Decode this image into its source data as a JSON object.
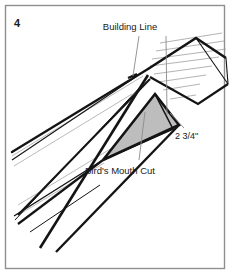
{
  "figure": {
    "number": "4",
    "type": "carpentry-rafter-detail"
  },
  "labels": {
    "building_line": "Building Line",
    "birds_mouth": "Bird's Mouth Cut",
    "dimension": "2 3/4\""
  },
  "colors": {
    "background": "#ffffff",
    "border": "#8f8f8f",
    "ink": "#141414",
    "hatch": "#9a9a9a",
    "leader": "#8a8a8a",
    "wedge_fill": "#bdbdbd",
    "text": "#1a1a1a"
  },
  "geometry": {
    "frame": {
      "x": 5,
      "y": 5,
      "width": 220,
      "height": 264
    },
    "ridge_apex": {
      "x": 148,
      "y": 69
    },
    "birds_mouth_apex": {
      "x": 155,
      "y": 94
    },
    "notes": "Left sloping rafter descends to lower left; right roof plane hatched with thin parallel lines; shaded triangular wedge marks the bird's mouth cut."
  }
}
